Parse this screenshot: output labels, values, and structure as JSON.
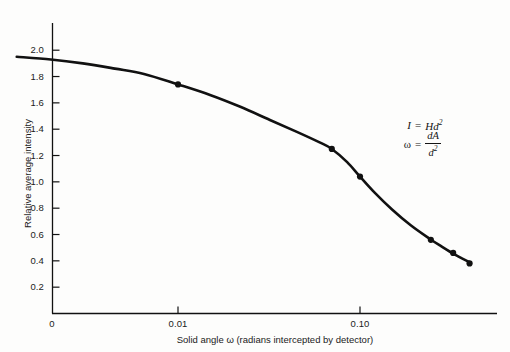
{
  "figure": {
    "background_color": "#fdfdfc",
    "ink_color": "#111111"
  },
  "axes": {
    "y_title": "Relative average intensity",
    "x_title": "Solid angle ω (radians intercepted by detector)",
    "origin_label": "0",
    "y_ticks": [
      "0.2",
      "0.4",
      "0.6",
      "0.8",
      "1.0",
      "1.2",
      "1.4",
      "1.6",
      "1.8",
      "2.0"
    ],
    "x_ticks": [
      "0.01",
      "0.10"
    ]
  },
  "annotation": {
    "eq1_lhs": "I",
    "eq1_eq": "=",
    "eq1_rhs_base": "Hd",
    "eq1_rhs_exp": "2",
    "eq2_lhs": "ω",
    "eq2_eq": "=",
    "eq2_num": "dA",
    "eq2_den_base": "d",
    "eq2_den_exp": "2"
  },
  "chart_data": {
    "type": "line",
    "title": "",
    "xlabel": "Solid angle ω (radians intercepted by detector)",
    "ylabel": "Relative average intensity",
    "x_scale": "log",
    "xlim": [
      0.001,
      0.45
    ],
    "ylim": [
      0,
      2.1
    ],
    "grid": false,
    "legend": "none",
    "x_tick_values": [
      0.01,
      0.1
    ],
    "x_tick_labels": [
      "0.01",
      "0.10"
    ],
    "y_tick_values": [
      0.2,
      0.4,
      0.6,
      0.8,
      1.0,
      1.2,
      1.4,
      1.6,
      1.8,
      2.0
    ],
    "y_tick_labels": [
      "0.2",
      "0.4",
      "0.6",
      "0.8",
      "1.0",
      "1.2",
      "1.4",
      "1.6",
      "1.8",
      "2.0"
    ],
    "series": [
      {
        "name": "Relative average intensity",
        "line_color": "#111111",
        "line_width": 2.6,
        "marker": "filled-circle",
        "curve": [
          {
            "x": 0.0013,
            "y": 1.95
          },
          {
            "x": 0.002,
            "y": 1.93
          },
          {
            "x": 0.003,
            "y": 1.9
          },
          {
            "x": 0.0045,
            "y": 1.86
          },
          {
            "x": 0.0065,
            "y": 1.82
          },
          {
            "x": 0.01,
            "y": 1.74
          },
          {
            "x": 0.015,
            "y": 1.66
          },
          {
            "x": 0.022,
            "y": 1.57
          },
          {
            "x": 0.032,
            "y": 1.47
          },
          {
            "x": 0.045,
            "y": 1.38
          },
          {
            "x": 0.06,
            "y": 1.3
          },
          {
            "x": 0.07,
            "y": 1.25
          },
          {
            "x": 0.085,
            "y": 1.15
          },
          {
            "x": 0.1,
            "y": 1.04
          },
          {
            "x": 0.12,
            "y": 0.92
          },
          {
            "x": 0.15,
            "y": 0.79
          },
          {
            "x": 0.19,
            "y": 0.67
          },
          {
            "x": 0.24,
            "y": 0.57
          },
          {
            "x": 0.28,
            "y": 0.51
          },
          {
            "x": 0.33,
            "y": 0.45
          },
          {
            "x": 0.4,
            "y": 0.39
          }
        ],
        "points": [
          {
            "x": 0.01,
            "y": 1.74
          },
          {
            "x": 0.07,
            "y": 1.25
          },
          {
            "x": 0.1,
            "y": 1.04
          },
          {
            "x": 0.245,
            "y": 0.56
          },
          {
            "x": 0.325,
            "y": 0.46
          },
          {
            "x": 0.4,
            "y": 0.38
          }
        ]
      }
    ]
  }
}
